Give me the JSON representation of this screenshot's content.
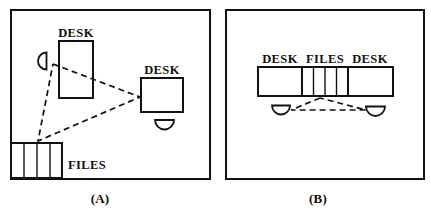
{
  "figure": {
    "title": "",
    "background_color": "#ffffff",
    "line_color": "#111111",
    "width": 431,
    "height": 213
  },
  "panels": [
    {
      "id": "A",
      "caption": "(A)",
      "frame": {
        "x": 11,
        "y": 10,
        "width": 199,
        "height": 169
      },
      "labels": {
        "desk_top": "DESK",
        "desk_right": "DESK",
        "files": "FILES"
      },
      "items": [
        {
          "name": "desk-top",
          "label": "DESK",
          "x": 59,
          "y": 41,
          "width": 34,
          "height": 57
        },
        {
          "name": "desk-right",
          "label": "DESK",
          "x": 141,
          "y": 78,
          "width": 42,
          "height": 34
        },
        {
          "name": "chair-left",
          "orientation": "flat-right"
        },
        {
          "name": "chair-right",
          "orientation": "flat-top"
        },
        {
          "name": "file-cabinet",
          "label": "FILES",
          "x": 11,
          "y": 143,
          "width": 51,
          "height": 35,
          "cells": 4
        }
      ],
      "sightlines": {
        "description": "dashed triangle linking the two workstations and the file cabinet",
        "vertices": [
          {
            "name": "chair-left-vertex",
            "x": 53,
            "y": 63
          },
          {
            "name": "desk-right-vertex",
            "x": 140,
            "y": 97
          },
          {
            "name": "files-vertex",
            "x": 38,
            "y": 141
          }
        ]
      }
    },
    {
      "id": "B",
      "caption": "(B)",
      "frame": {
        "x": 226,
        "y": 10,
        "width": 198,
        "height": 169
      },
      "labels": {
        "desk_left": "DESK",
        "files": "FILES",
        "desk_right": "DESK"
      },
      "items": [
        {
          "name": "desk-left",
          "label": "DESK",
          "x": 258,
          "y": 67,
          "width": 44,
          "height": 29
        },
        {
          "name": "file-cabinet",
          "label": "FILES",
          "x": 302,
          "y": 67,
          "width": 46,
          "height": 29,
          "cells": 4
        },
        {
          "name": "desk-right",
          "label": "DESK",
          "x": 348,
          "y": 67,
          "width": 45,
          "height": 29
        },
        {
          "name": "chair-left",
          "orientation": "flat-top"
        },
        {
          "name": "chair-right",
          "orientation": "flat-top"
        }
      ],
      "sightlines": {
        "description": "dashed triangle linking the two chairs and the shared file bank",
        "vertices": [
          {
            "name": "files-vertex",
            "x": 320,
            "y": 98
          },
          {
            "name": "chair-left-vertex",
            "x": 290,
            "y": 110
          },
          {
            "name": "chair-right-vertex",
            "x": 366,
            "y": 110
          }
        ]
      }
    }
  ]
}
